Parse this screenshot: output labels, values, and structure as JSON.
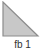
{
  "thumbnail": {
    "shape_icon": "right-triangle-icon",
    "label": "fb 1",
    "colors": {
      "fill": "#c8c8c8",
      "stroke": "#8c8c8c",
      "label": "#333333"
    }
  }
}
